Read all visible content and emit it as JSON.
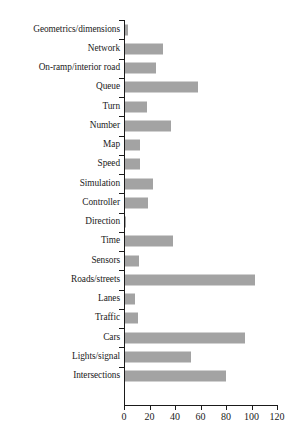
{
  "chart_data": {
    "type": "bar",
    "orientation": "horizontal",
    "title": "",
    "xlabel": "",
    "ylabel": "",
    "xlim": [
      0,
      120
    ],
    "xticks": [
      0,
      20,
      40,
      60,
      80,
      100,
      120
    ],
    "grid": false,
    "legend": null,
    "bar_color": "#a3a3a3",
    "axis_color": "#1a1a1a",
    "categories": [
      "Geometrics/dimensions",
      "Network",
      "On-ramp/interior road",
      "Queue",
      "Turn",
      "Number",
      "Map",
      "Speed",
      "Simulation",
      "Controller",
      "Direction",
      "Time",
      "Sensors",
      "Roads/streets",
      "Lanes",
      "Traffic",
      "Cars",
      "Lights/signal",
      "Intersections"
    ],
    "values": [
      2,
      30,
      24,
      57,
      17,
      36,
      12,
      12,
      22,
      18,
      1,
      38,
      11,
      102,
      8,
      10,
      94,
      52,
      79
    ]
  }
}
